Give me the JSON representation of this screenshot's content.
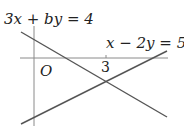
{
  "diagram": {
    "type": "coordinate-plane",
    "origin_label": "O",
    "x_tick_label": "3",
    "lines": [
      {
        "name": "line-1",
        "equation": "3x + by = 4"
      },
      {
        "name": "line-2",
        "equation": "x − 2y = 5"
      }
    ],
    "colors": {
      "axes": "#888888",
      "lines": "#555555",
      "text": "#222222"
    }
  },
  "labels": {
    "eq1": "3x + by = 4",
    "eq2": "x − 2y = 5",
    "origin": "O",
    "tick": "3"
  }
}
